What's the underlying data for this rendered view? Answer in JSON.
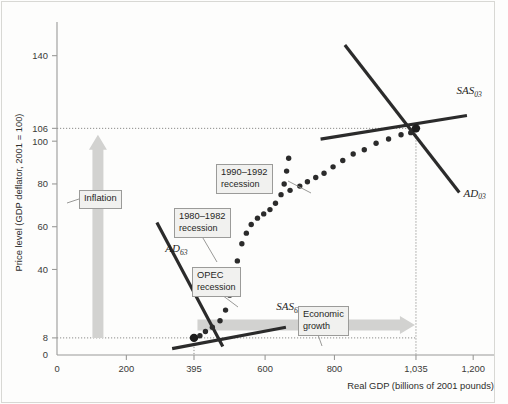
{
  "chart_data": {
    "type": "scatter",
    "title": "",
    "subtitle": "",
    "xlabel": "Real GDP (billions of 2001 pounds)",
    "ylabel": "Price level (GDP deflator, 2001 = 100)",
    "xlim": [
      0,
      1260
    ],
    "ylim": [
      0,
      152
    ],
    "grid": false,
    "legend_position": "none",
    "xticks": [
      {
        "value": 0,
        "label": "0"
      },
      {
        "value": 200,
        "label": "200"
      },
      {
        "value": 395,
        "label": "395"
      },
      {
        "value": 600,
        "label": "600"
      },
      {
        "value": 800,
        "label": "800"
      },
      {
        "value": 1035,
        "label": "1,035"
      },
      {
        "value": 1200,
        "label": "1,200"
      }
    ],
    "yticks": [
      {
        "value": 140,
        "label": "140"
      },
      {
        "value": 106,
        "label": "106"
      },
      {
        "value": 100,
        "label": "100"
      },
      {
        "value": 80,
        "label": "80"
      },
      {
        "value": 60,
        "label": "60"
      },
      {
        "value": 40,
        "label": "40"
      },
      {
        "value": 8,
        "label": "8"
      },
      {
        "value": 0,
        "label": "0"
      }
    ],
    "reference_lines": [
      {
        "name": "price-level-1963",
        "axis": "y",
        "value": 8,
        "style": "dotted"
      },
      {
        "name": "price-level-2003",
        "axis": "y",
        "value": 106,
        "style": "dotted"
      },
      {
        "name": "real-gdp-1963",
        "axis": "x",
        "value": 395,
        "style": "dotted"
      },
      {
        "name": "real-gdp-2003",
        "axis": "x",
        "value": 1035,
        "style": "dotted"
      }
    ],
    "equilibria": [
      {
        "name": "1963 equilibrium",
        "x": 395,
        "y": 8
      },
      {
        "name": "2003 equilibrium",
        "x": 1035,
        "y": 106
      }
    ],
    "series": [
      {
        "name": "Macroeconomic path 1963-2003",
        "marker": "filled-circle",
        "color": "#2b2b2b",
        "points": [
          [
            395,
            8
          ],
          [
            412,
            9
          ],
          [
            428,
            11
          ],
          [
            448,
            13
          ],
          [
            470,
            16
          ],
          [
            486,
            21
          ],
          [
            498,
            28
          ],
          [
            508,
            36
          ],
          [
            520,
            44
          ],
          [
            533,
            52
          ],
          [
            546,
            57
          ],
          [
            560,
            61
          ],
          [
            578,
            64
          ],
          [
            596,
            66
          ],
          [
            614,
            68
          ],
          [
            630,
            71
          ],
          [
            646,
            75
          ],
          [
            655,
            80
          ],
          [
            662,
            86
          ],
          [
            668,
            92
          ],
          [
            672,
            77
          ],
          [
            700,
            79
          ],
          [
            722,
            81
          ],
          [
            746,
            83
          ],
          [
            770,
            85
          ],
          [
            796,
            88
          ],
          [
            824,
            91
          ],
          [
            854,
            94
          ],
          [
            886,
            96
          ],
          [
            920,
            99
          ],
          [
            956,
            101
          ],
          [
            992,
            103
          ],
          [
            1020,
            104
          ],
          [
            1035,
            106
          ]
        ]
      }
    ],
    "curves": [
      {
        "name": "AD63",
        "label": "AD",
        "sub": "63",
        "x1": 288,
        "y1": 62,
        "x2": 478,
        "y2": 4,
        "label_x": 312,
        "label_y": 48
      },
      {
        "name": "SAS63",
        "label": "SAS",
        "sub": "63",
        "x1": 332,
        "y1": 3,
        "x2": 660,
        "y2": 13,
        "label_x": 632,
        "label_y": 21
      },
      {
        "name": "AD03",
        "label": "AD",
        "sub": "03",
        "x1": 830,
        "y1": 145,
        "x2": 1160,
        "y2": 76,
        "label_x": 1172,
        "label_y": 74
      },
      {
        "name": "SAS03",
        "label": "SAS",
        "sub": "03",
        "x1": 760,
        "y1": 101,
        "x2": 1182,
        "y2": 112,
        "label_x": 1152,
        "label_y": 122
      }
    ],
    "annotations": [
      {
        "name": "inflation",
        "text": "Inflation",
        "kind": "callout-box"
      },
      {
        "name": "economic-growth",
        "text_line1": "Economic",
        "text_line2": "growth",
        "kind": "callout-box"
      },
      {
        "name": "opec-recession",
        "text_line1": "OPEC",
        "text_line2": "recession",
        "kind": "callout-box"
      },
      {
        "name": "recession-1980-1982",
        "text_line1": "1980–1982",
        "text_line2": "recession",
        "kind": "callout-box"
      },
      {
        "name": "recession-1990-1992",
        "text_line1": "1990–1992",
        "text_line2": "recession",
        "kind": "callout-box"
      }
    ],
    "arrows": [
      {
        "name": "inflation-arrow",
        "direction": "up",
        "color": "#d2d2d0"
      },
      {
        "name": "economic-growth-arrow",
        "direction": "right",
        "color": "#d2d2d0"
      }
    ]
  },
  "axes": {
    "y_title": "Price level (GDP deflator, 2001 = 100)",
    "x_title": "Real GDP (billions of 2001 pounds)"
  },
  "curve_labels": {
    "ad63": {
      "main": "AD",
      "sub": "63"
    },
    "sas63": {
      "main": "SAS",
      "sub": "63"
    },
    "ad03": {
      "main": "AD",
      "sub": "03"
    },
    "sas03": {
      "main": "SAS",
      "sub": "03"
    }
  },
  "callouts": {
    "inflation": {
      "line1": "Inflation",
      "line2": ""
    },
    "growth": {
      "line1": "Economic",
      "line2": "growth"
    },
    "opec": {
      "line1": "OPEC",
      "line2": "recession"
    },
    "rec80": {
      "line1": "1980–1982",
      "line2": "recession"
    },
    "rec90": {
      "line1": "1990–1992",
      "line2": "recession"
    }
  },
  "colors": {
    "curve": "#2b2b2b",
    "marker": "#2b2b2b",
    "axis": "#9a9a98",
    "arrow": "#d2d2d0",
    "callout_bg": "#f1f1ef",
    "callout_border": "#9b9b99"
  }
}
